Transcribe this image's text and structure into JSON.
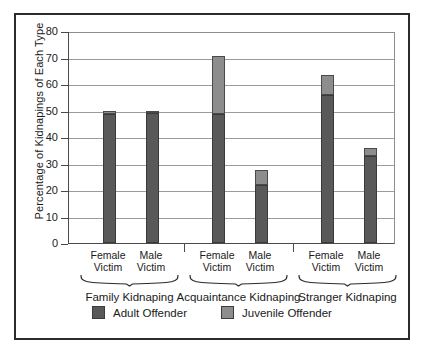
{
  "chart_data": {
    "type": "bar",
    "title": "",
    "subtitle": "",
    "xlabel": "",
    "ylabel": "Percentage of Kidnapings of Each Type",
    "ylim": [
      0,
      80
    ],
    "yticks": [
      0,
      10,
      20,
      30,
      40,
      50,
      60,
      70,
      80
    ],
    "ytick_labels": [
      "0",
      "10",
      "20",
      "30",
      "40",
      "50",
      "60",
      "70",
      "80"
    ],
    "grid": "horizontal",
    "stacked": true,
    "legend_position": "bottom-center",
    "legend": [
      "Adult Offender",
      "Juvenile Offender"
    ],
    "groups": [
      {
        "name": "Family Kidnaping",
        "categories": [
          "Female Victim",
          "Male Victim"
        ]
      },
      {
        "name": "Acquaintance Kidnaping",
        "categories": [
          "Female Victim",
          "Male Victim"
        ]
      },
      {
        "name": "Stranger Kidnaping",
        "categories": [
          "Female Victim",
          "Male Victim"
        ]
      }
    ],
    "categories": [
      "Family Kidnaping - Female Victim",
      "Family Kidnaping - Male Victim",
      "Acquaintance Kidnaping - Female Victim",
      "Acquaintance Kidnaping - Male Victim",
      "Stranger Kidnaping - Female Victim",
      "Stranger Kidnaping - Male Victim"
    ],
    "series": [
      {
        "name": "Adult Offender",
        "color": "#595959",
        "values": [
          48.5,
          49.0,
          48.5,
          22.0,
          56.0,
          33.0
        ]
      },
      {
        "name": "Juvenile Offender",
        "color": "#8d8d8d",
        "values": [
          1.5,
          1.0,
          22.0,
          5.5,
          7.5,
          3.0
        ]
      }
    ],
    "totals": [
      50.0,
      50.0,
      70.5,
      27.5,
      63.5,
      36.0
    ]
  },
  "axis": {
    "y_title": "Percentage of Kidnapings of Each Type",
    "tick_labels": [
      "80",
      "70",
      "60",
      "50",
      "40",
      "30",
      "20",
      "10",
      "0"
    ]
  },
  "xaxis": {
    "ticks": [
      {
        "line1": "Female",
        "line2": "Victim"
      },
      {
        "line1": "Male",
        "line2": "Victim"
      },
      {
        "line1": "Female",
        "line2": "Victim"
      },
      {
        "line1": "Male",
        "line2": "Victim"
      },
      {
        "line1": "Female",
        "line2": "Victim"
      },
      {
        "line1": "Male",
        "line2": "Victim"
      }
    ],
    "groups": [
      "Family Kidnaping",
      "Acquaintance Kidnaping",
      "Stranger Kidnaping"
    ]
  },
  "legend": {
    "items": [
      {
        "label": "Adult Offender",
        "color": "#595959"
      },
      {
        "label": "Juvenile Offender",
        "color": "#8d8d8d"
      }
    ]
  },
  "colors": {
    "adult": "#595959",
    "juvenile": "#8d8d8d",
    "axis": "#4a4a4a",
    "grid": "#9b9b9b",
    "frame": "#2b2b2b",
    "text": "#1a1a1a",
    "background": "#ffffff"
  }
}
